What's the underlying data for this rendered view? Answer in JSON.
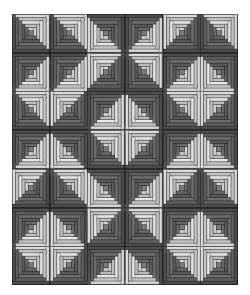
{
  "quilt": {
    "name": "log-cabin-quilt",
    "rows": 7,
    "cols": 6,
    "colors": {
      "dark_strips": [
        "#4d4d4d",
        "#5e5e5e",
        "#6e6e6e",
        "#585858",
        "#686868"
      ],
      "light_strips": [
        "#d9d9d9",
        "#c4c4c4",
        "#e6e6e6",
        "#bdbdbd",
        "#d0d0d0"
      ],
      "center": "#7a7a7a",
      "seam": "#1e1e1e"
    },
    "dark_corner_grid": [
      [
        "BL",
        "BL",
        "TR",
        "TL",
        "BR",
        "BL"
      ],
      [
        "TL",
        "TL",
        "BR",
        "BL",
        "TL",
        "TR"
      ],
      [
        "BL",
        "BR",
        "TL",
        "TR",
        "BL",
        "BR"
      ],
      [
        "TL",
        "TR",
        "BL",
        "BR",
        "TL",
        "TR"
      ],
      [
        "BR",
        "BL",
        "TR",
        "TL",
        "BR",
        "BL"
      ],
      [
        "TL",
        "TR",
        "BR",
        "BL",
        "TL",
        "TR"
      ],
      [
        "BL",
        "BR",
        "TL",
        "TR",
        "BL",
        "BR"
      ]
    ]
  }
}
